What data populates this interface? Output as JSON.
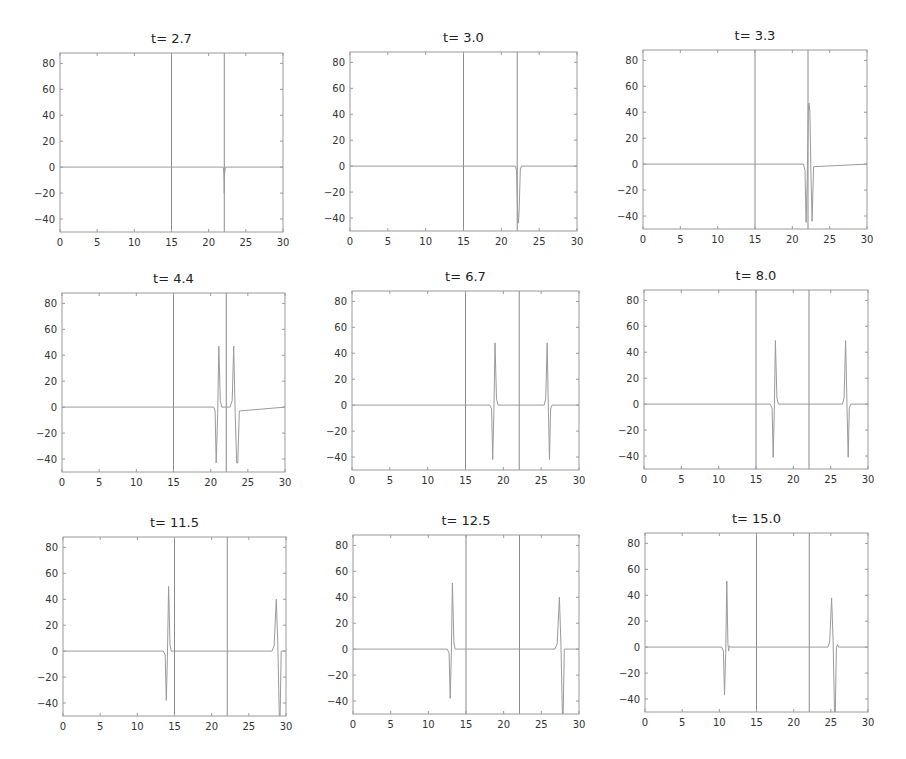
{
  "chart_data": {
    "type": "line",
    "layout": {
      "rows": 3,
      "cols": 3,
      "grid": false,
      "legend": "none"
    },
    "shared": {
      "xlim": [
        0,
        30
      ],
      "ylim": [
        -50,
        88
      ],
      "xticks": [
        0,
        5,
        10,
        15,
        20,
        25,
        30
      ],
      "yticks": [
        -40,
        -20,
        0,
        20,
        40,
        60,
        80
      ],
      "xlabel": "",
      "ylabel": "",
      "vertical_lines_x": [
        15,
        22.1
      ],
      "line_color": "#9a9a9a",
      "vline_color": "#8a8a8a",
      "axis_color": "#9a9a9a"
    },
    "panels": [
      {
        "title": "t= 2.7",
        "box": [
          60,
          53,
          283,
          232
        ],
        "series": {
          "x": [
            0,
            21.95,
            22.05,
            22.1,
            22.15,
            22.25,
            30
          ],
          "y": [
            0,
            0,
            -5,
            -20,
            -5,
            0,
            0
          ]
        }
      },
      {
        "title": "t= 3.0",
        "box": [
          350,
          52,
          577,
          231
        ],
        "series": {
          "x": [
            0,
            21.85,
            22.0,
            22.15,
            22.25,
            22.35,
            22.5,
            22.65,
            30
          ],
          "y": [
            0,
            0,
            -3,
            -35,
            -44,
            -35,
            -3,
            0,
            0
          ]
        }
      },
      {
        "title": "t= 3.3",
        "box": [
          643,
          50,
          867,
          229
        ],
        "series": {
          "x": [
            0,
            21.5,
            21.7,
            21.85,
            22.0,
            22.15,
            22.25,
            22.35,
            22.5,
            22.65,
            22.85,
            30
          ],
          "y": [
            0,
            0,
            -5,
            -45,
            -10,
            46,
            47,
            40,
            -10,
            -44,
            -2,
            0
          ]
        }
      },
      {
        "title": "t= 4.4",
        "box": [
          62,
          293,
          285,
          472
        ],
        "series": {
          "x": [
            0,
            20.4,
            20.6,
            20.75,
            20.95,
            21.1,
            21.3,
            21.5,
            22.6,
            22.9,
            23.1,
            23.3,
            23.5,
            23.65,
            23.85,
            30
          ],
          "y": [
            0,
            0,
            -3,
            -43,
            -5,
            47,
            5,
            0,
            0,
            5,
            47,
            -5,
            -43,
            -43,
            -3,
            0
          ]
        }
      },
      {
        "title": "t= 6.7",
        "box": [
          352,
          291,
          579,
          470
        ],
        "series": {
          "x": [
            0,
            18.2,
            18.45,
            18.6,
            18.75,
            18.9,
            19.1,
            19.3,
            25.4,
            25.6,
            25.8,
            25.95,
            26.1,
            26.25,
            26.45,
            30
          ],
          "y": [
            0,
            0,
            -3,
            -42,
            -5,
            48,
            5,
            0,
            0,
            5,
            48,
            -5,
            -42,
            -3,
            0,
            0
          ]
        }
      },
      {
        "title": "t= 8.0",
        "box": [
          644,
          290,
          868,
          469
        ],
        "series": {
          "x": [
            0,
            16.9,
            17.15,
            17.3,
            17.45,
            17.6,
            17.8,
            18.0,
            26.6,
            26.8,
            27.0,
            27.2,
            27.35,
            27.5,
            27.7,
            30
          ],
          "y": [
            0,
            0,
            -3,
            -41,
            -5,
            49,
            5,
            0,
            0,
            5,
            49,
            -5,
            -41,
            -3,
            0,
            0
          ]
        }
      },
      {
        "title": "t= 11.5",
        "box": [
          63,
          537,
          286,
          716
        ],
        "series": {
          "x": [
            0,
            13.5,
            13.75,
            13.9,
            14.05,
            14.2,
            14.4,
            14.55,
            28.1,
            28.4,
            28.7,
            28.9,
            29.1,
            29.2,
            29.35,
            29.5,
            30
          ],
          "y": [
            0,
            0,
            -3,
            -38,
            -5,
            50,
            5,
            0,
            0,
            4,
            40,
            5,
            -50,
            -50,
            0,
            0,
            0
          ]
        }
      },
      {
        "title": "t= 12.5",
        "box": [
          353,
          535,
          579,
          714
        ],
        "series": {
          "x": [
            0,
            12.5,
            12.75,
            12.9,
            13.05,
            13.2,
            13.4,
            13.55,
            26.8,
            27.1,
            27.4,
            27.6,
            27.8,
            27.9,
            28.05,
            28.2,
            30
          ],
          "y": [
            0,
            0,
            -3,
            -38,
            -5,
            51,
            5,
            0,
            0,
            4,
            40,
            5,
            -50,
            -50,
            0,
            0,
            0
          ]
        }
      },
      {
        "title": "t= 15.0",
        "box": [
          645,
          533,
          868,
          712
        ],
        "series": {
          "x": [
            0,
            10.3,
            10.55,
            10.7,
            10.85,
            11.0,
            11.15,
            11.25,
            11.35,
            11.5,
            24.6,
            24.85,
            25.1,
            25.3,
            25.5,
            25.6,
            25.75,
            25.9,
            26.05,
            30
          ],
          "y": [
            0,
            0,
            -3,
            -37,
            -5,
            51,
            3,
            -3,
            1,
            0,
            0,
            4,
            38,
            5,
            -50,
            -50,
            0,
            2,
            0,
            0
          ]
        }
      }
    ]
  }
}
